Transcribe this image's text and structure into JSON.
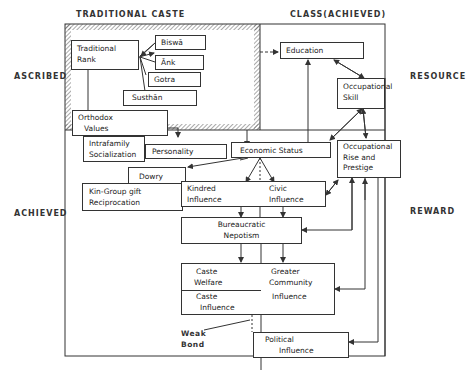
{
  "headers": {
    "left_column": "TRADITIONAL CASTE",
    "right_column": "CLASS(ACHIEVED)"
  },
  "side_labels": {
    "ascribed": "ASCRIBED",
    "achieved": "ACHIEVED",
    "resource": "RESOURCE",
    "reward": "REWARD"
  },
  "nodes": {
    "traditional_rank": {
      "line1": "Traditional",
      "line2": "Rank"
    },
    "biswa": "Biswā",
    "ank": "Ānk",
    "gotra": "Gotra",
    "susthan": "Susthān",
    "orthodox_values": {
      "line1": "Orthodox",
      "line2": "Values"
    },
    "intrafamily_socialization": {
      "line1": "Intrafamily",
      "line2": "Socialization"
    },
    "personality": "Personality",
    "economic_status": "Economic Status",
    "education": "Education",
    "occupational_skill": {
      "line1": "Occupational",
      "line2": "Skill"
    },
    "occupational_rise": {
      "line1": "Occupational",
      "line2": "Rise   and",
      "line3": "Prestige"
    },
    "dowry": "Dowry",
    "kin_group": {
      "line1": "Kin-Group gift",
      "line2": "Reciprocation"
    },
    "kindred_influence": {
      "line1": "Kindred",
      "line2": "Influence"
    },
    "civic_influence": {
      "line1": "Civic",
      "line2": "Influence"
    },
    "bureaucratic_nepotism": {
      "line1": "Bureaucratic",
      "line2": "Nepotism"
    },
    "caste_welfare": {
      "line1": "Caste",
      "line2": "Welfare"
    },
    "caste_influence": {
      "line1": "Caste",
      "line2": "Influence"
    },
    "greater_community": {
      "line1": "Greater",
      "line2": "Community"
    },
    "greater_influence": "Influence",
    "political_influence": {
      "line1": "Political",
      "line2": "Influence"
    }
  },
  "annotations": {
    "weak_bond": {
      "line1": "Weak",
      "line2": "Bond"
    }
  },
  "colors": {
    "line": "#333333",
    "hatch": "#555555",
    "background": "#ffffff"
  }
}
